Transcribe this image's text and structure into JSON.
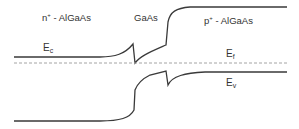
{
  "diagram": {
    "regions": [
      {
        "label": "n",
        "sup": "+",
        "suffix": " - AlGaAs"
      },
      {
        "label": "GaAs"
      },
      {
        "label": "p",
        "sup": "+",
        "suffix": " - AlGaAs"
      }
    ],
    "bands": {
      "conduction": {
        "label": "E",
        "sub": "c"
      },
      "fermi": {
        "label": "E",
        "sub": "f"
      },
      "valence": {
        "label": "E",
        "sub": "v"
      }
    },
    "colors": {
      "band_line": "#3a3a3a",
      "fermi_line": "#9a9a9a",
      "text": "#333333"
    }
  }
}
